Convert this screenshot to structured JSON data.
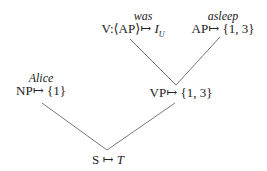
{
  "tree": {
    "nodes": {
      "v": {
        "word": "was",
        "cat": "V:⟨AP⟩",
        "arrow": "↦",
        "value_main": "I",
        "value_sub": "U"
      },
      "ap": {
        "word": "asleep",
        "cat": "AP",
        "arrow": "↦",
        "value": "{1, 3}"
      },
      "np": {
        "word": "Alice",
        "cat": "NP",
        "arrow": "↦",
        "value": "{1}"
      },
      "vp": {
        "cat": "VP",
        "arrow": "↦",
        "value": "{1, 3}"
      },
      "s": {
        "cat": "S",
        "arrow": "↦",
        "value": "T"
      }
    },
    "edges": [
      {
        "from": "v",
        "to": "vp"
      },
      {
        "from": "ap",
        "to": "vp"
      },
      {
        "from": "np",
        "to": "s"
      },
      {
        "from": "vp",
        "to": "s"
      }
    ]
  }
}
